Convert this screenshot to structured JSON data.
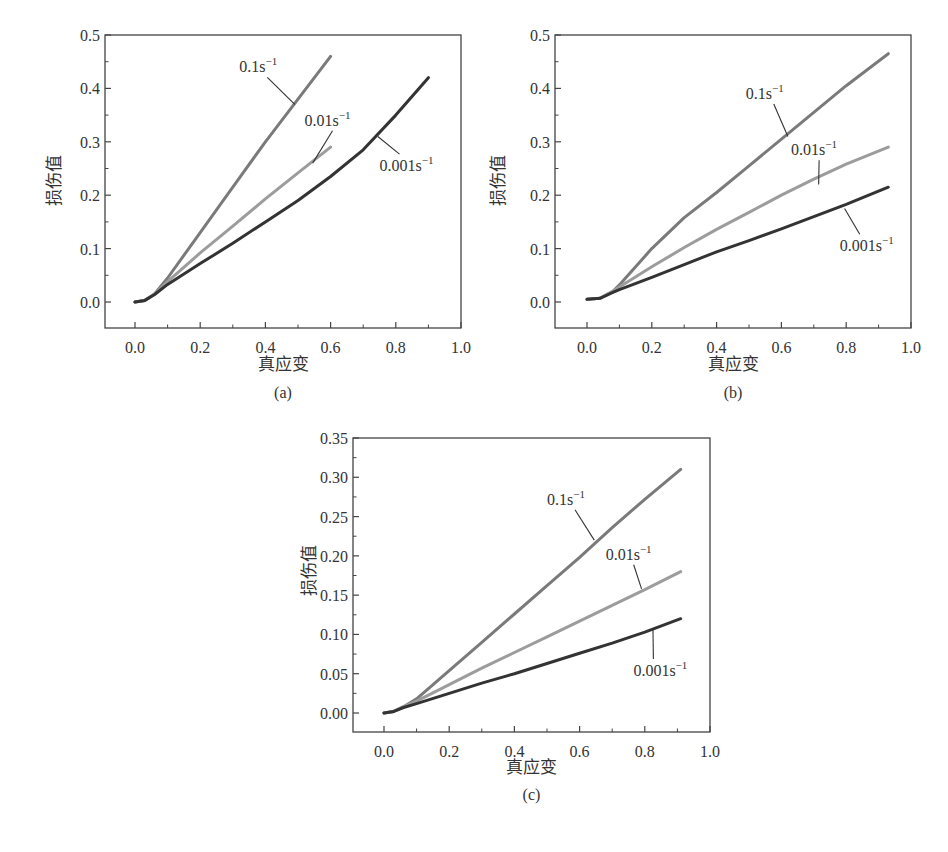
{
  "figure": {
    "panels": [
      "(a)",
      "(b)",
      "(c)"
    ]
  },
  "chart_data": [
    {
      "type": "line",
      "panel": "(a)",
      "title": "",
      "xlabel": "真应变",
      "ylabel": "损伤值",
      "xlim": [
        -0.09,
        1.0
      ],
      "ylim": [
        -0.045,
        0.5
      ],
      "xticks": [
        "0.0",
        "0.2",
        "0.4",
        "0.6",
        "0.8",
        "1.0"
      ],
      "yticks": [
        "0.0",
        "0.1",
        "0.2",
        "0.3",
        "0.4",
        "0.5"
      ],
      "grid": false,
      "series": [
        {
          "name": "0.1s⁻¹",
          "color": "#7a7a7a",
          "x": [
            0.0,
            0.03,
            0.06,
            0.1,
            0.2,
            0.3,
            0.4,
            0.5,
            0.6
          ],
          "y": [
            0.0,
            0.003,
            0.015,
            0.045,
            0.13,
            0.215,
            0.3,
            0.38,
            0.46
          ],
          "label_pos": [
            0.32,
            0.43
          ],
          "leader_to": [
            0.49,
            0.37
          ]
        },
        {
          "name": "0.01s⁻¹",
          "color": "#9c9c9c",
          "x": [
            0.0,
            0.03,
            0.06,
            0.1,
            0.2,
            0.3,
            0.4,
            0.5,
            0.6
          ],
          "y": [
            0.0,
            0.003,
            0.015,
            0.038,
            0.092,
            0.142,
            0.193,
            0.242,
            0.29
          ],
          "label_pos": [
            0.52,
            0.33
          ],
          "leader_to": [
            0.545,
            0.26
          ]
        },
        {
          "name": "0.001s⁻¹",
          "color": "#333333",
          "x": [
            0.0,
            0.03,
            0.06,
            0.1,
            0.2,
            0.3,
            0.4,
            0.5,
            0.6,
            0.7,
            0.8,
            0.9
          ],
          "y": [
            0.0,
            0.003,
            0.014,
            0.033,
            0.072,
            0.11,
            0.15,
            0.19,
            0.235,
            0.285,
            0.35,
            0.42
          ],
          "label_pos": [
            0.75,
            0.245
          ],
          "leader_to": [
            0.745,
            0.31
          ]
        }
      ]
    },
    {
      "type": "line",
      "panel": "(b)",
      "title": "",
      "xlabel": "真应变",
      "ylabel": "损伤值",
      "xlim": [
        -0.1,
        1.0
      ],
      "ylim": [
        -0.045,
        0.5
      ],
      "xticks": [
        "0.0",
        "0.2",
        "0.4",
        "0.6",
        "0.8",
        "1.0"
      ],
      "yticks": [
        "0.0",
        "0.1",
        "0.2",
        "0.3",
        "0.4",
        "0.5"
      ],
      "grid": false,
      "series": [
        {
          "name": "0.1s⁻¹",
          "color": "#7a7a7a",
          "x": [
            0.0,
            0.04,
            0.08,
            0.1,
            0.2,
            0.3,
            0.4,
            0.5,
            0.6,
            0.7,
            0.8,
            0.93
          ],
          "y": [
            0.005,
            0.007,
            0.02,
            0.032,
            0.1,
            0.158,
            0.205,
            0.255,
            0.305,
            0.355,
            0.405,
            0.465
          ],
          "label_pos": [
            0.49,
            0.38
          ],
          "leader_to": [
            0.62,
            0.31
          ]
        },
        {
          "name": "0.01s⁻¹",
          "color": "#9c9c9c",
          "x": [
            0.0,
            0.04,
            0.08,
            0.1,
            0.2,
            0.3,
            0.4,
            0.5,
            0.6,
            0.7,
            0.8,
            0.93
          ],
          "y": [
            0.005,
            0.007,
            0.02,
            0.028,
            0.066,
            0.102,
            0.136,
            0.168,
            0.2,
            0.23,
            0.258,
            0.29
          ],
          "label_pos": [
            0.63,
            0.275
          ],
          "leader_to": [
            0.715,
            0.22
          ]
        },
        {
          "name": "0.001s⁻¹",
          "color": "#333333",
          "x": [
            0.0,
            0.04,
            0.08,
            0.1,
            0.2,
            0.3,
            0.4,
            0.5,
            0.6,
            0.7,
            0.8,
            0.93
          ],
          "y": [
            0.005,
            0.007,
            0.018,
            0.023,
            0.046,
            0.07,
            0.094,
            0.115,
            0.137,
            0.16,
            0.183,
            0.215
          ],
          "label_pos": [
            0.78,
            0.095
          ],
          "leader_to": [
            0.795,
            0.175
          ]
        }
      ]
    },
    {
      "type": "line",
      "panel": "(c)",
      "title": "",
      "xlabel": "真应变",
      "ylabel": "损伤值",
      "xlim": [
        -0.095,
        1.0
      ],
      "ylim": [
        -0.024,
        0.35
      ],
      "xticks": [
        "0.0",
        "0.2",
        "0.4",
        "0.6",
        "0.8",
        "1.0"
      ],
      "yticks": [
        "0.00",
        "0.05",
        "0.10",
        "0.15",
        "0.20",
        "0.25",
        "0.30",
        "0.35"
      ],
      "grid": false,
      "series": [
        {
          "name": "0.1s⁻¹",
          "color": "#7a7a7a",
          "x": [
            0.0,
            0.03,
            0.06,
            0.1,
            0.2,
            0.3,
            0.4,
            0.5,
            0.6,
            0.7,
            0.8,
            0.91
          ],
          "y": [
            0.0,
            0.002,
            0.008,
            0.018,
            0.054,
            0.09,
            0.126,
            0.162,
            0.198,
            0.236,
            0.272,
            0.31
          ],
          "label_pos": [
            0.5,
            0.265
          ],
          "leader_to": [
            0.645,
            0.22
          ]
        },
        {
          "name": "0.01s⁻¹",
          "color": "#9c9c9c",
          "x": [
            0.0,
            0.03,
            0.06,
            0.1,
            0.2,
            0.3,
            0.4,
            0.5,
            0.6,
            0.7,
            0.8,
            0.91
          ],
          "y": [
            0.0,
            0.002,
            0.008,
            0.015,
            0.036,
            0.057,
            0.077,
            0.097,
            0.117,
            0.137,
            0.157,
            0.18
          ],
          "label_pos": [
            0.68,
            0.195
          ],
          "leader_to": [
            0.79,
            0.158
          ]
        },
        {
          "name": "0.001s⁻¹",
          "color": "#333333",
          "x": [
            0.0,
            0.03,
            0.06,
            0.1,
            0.2,
            0.3,
            0.4,
            0.5,
            0.6,
            0.7,
            0.8,
            0.91
          ],
          "y": [
            0.0,
            0.002,
            0.007,
            0.012,
            0.025,
            0.038,
            0.05,
            0.063,
            0.076,
            0.089,
            0.103,
            0.12
          ],
          "label_pos": [
            0.765,
            0.047
          ],
          "leader_to": [
            0.825,
            0.108
          ]
        }
      ]
    }
  ]
}
